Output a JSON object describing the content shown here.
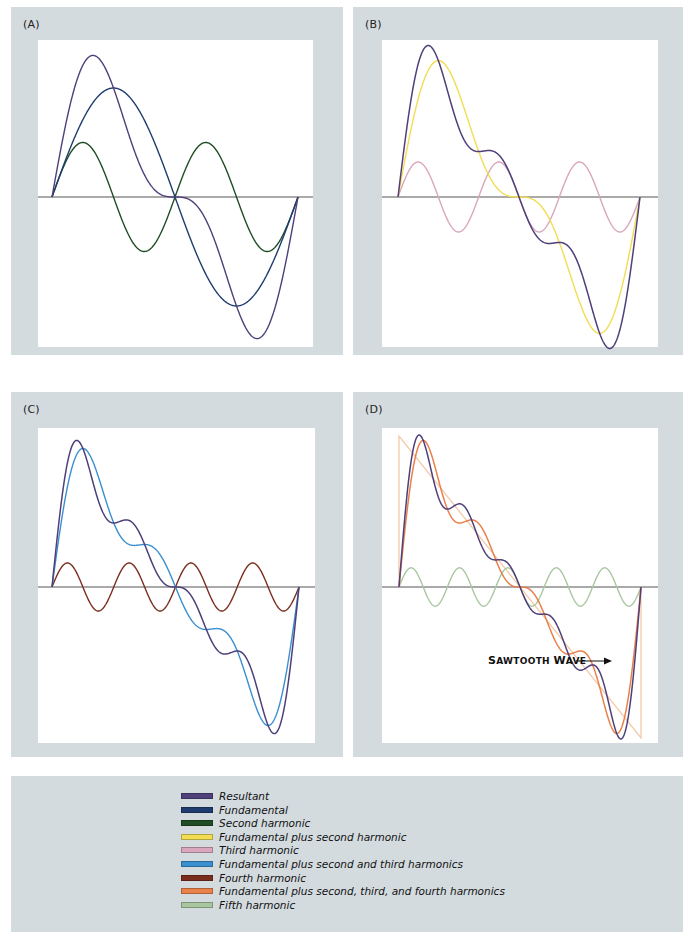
{
  "figure": {
    "background_panel_color": "#d4dbdf",
    "plot_color": "#ffffff",
    "axis_color": "#555555"
  },
  "colors": {
    "resultant": "#4f3f7a",
    "fundamental": "#1e3c6e",
    "second_harmonic": "#1f4d24",
    "fund_plus_second": "#f2dc52",
    "third_harmonic": "#d9a7bd",
    "fund_plus_second_third": "#3a8fcf",
    "fourth_harmonic": "#7a2d1c",
    "fund_plus_second_third_fourth": "#e8814a",
    "fifth_harmonic": "#a8c7a0",
    "sawtooth": "#f3c9a8"
  },
  "panels": [
    {
      "id": "A",
      "label": "(A)",
      "outer": [
        11,
        7,
        332,
        348
      ],
      "plot": [
        38,
        40,
        275,
        307
      ],
      "axis_y": 197,
      "x0": 52,
      "x1": 298,
      "amp": 109,
      "curves": [
        {
          "name": "Second harmonic",
          "color_key": "second_harmonic",
          "harmonics": [
            2
          ],
          "width": 1.4
        },
        {
          "name": "Fundamental",
          "color_key": "fundamental",
          "harmonics": [
            1
          ],
          "width": 1.4
        },
        {
          "name": "Resultant",
          "color_key": "resultant",
          "harmonics": [
            1,
            2
          ],
          "width": 1.4
        }
      ]
    },
    {
      "id": "B",
      "label": "(B)",
      "outer": [
        353,
        7,
        330,
        348
      ],
      "plot": [
        382,
        40,
        276,
        307
      ],
      "axis_y": 197,
      "x0": 398,
      "x1": 640,
      "amp": 105,
      "curves": [
        {
          "name": "Third harmonic",
          "color_key": "third_harmonic",
          "harmonics": [
            3
          ],
          "width": 1.4
        },
        {
          "name": "Fundamental plus second harmonic",
          "color_key": "fund_plus_second",
          "harmonics": [
            1,
            2
          ],
          "width": 1.4
        },
        {
          "name": "Resultant",
          "color_key": "resultant",
          "harmonics": [
            1,
            2,
            3
          ],
          "width": 1.5
        }
      ]
    },
    {
      "id": "C",
      "label": "(C)",
      "outer": [
        11,
        392,
        332,
        365
      ],
      "plot": [
        38,
        428,
        277,
        315
      ],
      "axis_y": 587,
      "x0": 52,
      "x1": 299,
      "amp": 96,
      "curves": [
        {
          "name": "Fourth harmonic",
          "color_key": "fourth_harmonic",
          "harmonics": [
            4
          ],
          "width": 1.4
        },
        {
          "name": "Fundamental plus second and third harmonics",
          "color_key": "fund_plus_second_third",
          "harmonics": [
            1,
            2,
            3
          ],
          "width": 1.4
        },
        {
          "name": "Resultant",
          "color_key": "resultant",
          "harmonics": [
            1,
            2,
            3,
            4
          ],
          "width": 1.5
        }
      ]
    },
    {
      "id": "D",
      "label": "(D)",
      "outer": [
        353,
        392,
        330,
        365
      ],
      "plot": [
        382,
        428,
        276,
        315
      ],
      "axis_y": 587,
      "x0": 399,
      "x1": 641,
      "amp": 96,
      "sawtooth": true,
      "curves": [
        {
          "name": "Fifth harmonic",
          "color_key": "fifth_harmonic",
          "harmonics": [
            5
          ],
          "width": 1.4
        },
        {
          "name": "Fundamental plus second, third, and fourth harmonics",
          "color_key": "fund_plus_second_third_fourth",
          "harmonics": [
            1,
            2,
            3,
            4
          ],
          "width": 1.5
        },
        {
          "name": "Resultant",
          "color_key": "resultant",
          "harmonics": [
            1,
            2,
            3,
            4,
            5
          ],
          "width": 1.5
        }
      ],
      "annotation": {
        "text_s": "S",
        "text_rest1": "AWTOOTH ",
        "text_w": "W",
        "text_rest2": "AVE",
        "x": 488,
        "y": 654
      }
    }
  ],
  "legend": {
    "items": [
      {
        "label": "Resultant",
        "color_key": "resultant"
      },
      {
        "label": "Fundamental",
        "color_key": "fundamental"
      },
      {
        "label": "Second harmonic",
        "color_key": "second_harmonic"
      },
      {
        "label": "Fundamental plus second harmonic",
        "color_key": "fund_plus_second"
      },
      {
        "label": "Third harmonic",
        "color_key": "third_harmonic"
      },
      {
        "label": "Fundamental plus second and third harmonics",
        "color_key": "fund_plus_second_third"
      },
      {
        "label": "Fourth harmonic",
        "color_key": "fourth_harmonic"
      },
      {
        "label": "Fundamental plus second, third, and fourth harmonics",
        "color_key": "fund_plus_second_third_fourth"
      },
      {
        "label": "Fifth harmonic",
        "color_key": "fifth_harmonic"
      }
    ]
  },
  "chart_data": [
    {
      "type": "line",
      "title": "(A)",
      "x": "one period, 0 to 2π",
      "series": [
        {
          "name": "Fundamental",
          "formula": "sin(x)"
        },
        {
          "name": "Second harmonic",
          "formula": "sin(2x)/2"
        },
        {
          "name": "Resultant",
          "formula": "sin(x)+sin(2x)/2"
        }
      ]
    },
    {
      "type": "line",
      "title": "(B)",
      "series": [
        {
          "name": "Fundamental plus second harmonic",
          "formula": "sin(x)+sin(2x)/2"
        },
        {
          "name": "Third harmonic",
          "formula": "sin(3x)/3"
        },
        {
          "name": "Resultant",
          "formula": "sum n=1..3 sin(nx)/n"
        }
      ]
    },
    {
      "type": "line",
      "title": "(C)",
      "series": [
        {
          "name": "Fundamental plus second and third harmonics",
          "formula": "sum n=1..3 sin(nx)/n"
        },
        {
          "name": "Fourth harmonic",
          "formula": "sin(4x)/4"
        },
        {
          "name": "Resultant",
          "formula": "sum n=1..4 sin(nx)/n"
        }
      ]
    },
    {
      "type": "line",
      "title": "(D)",
      "series": [
        {
          "name": "Fundamental plus second, third, and fourth harmonics",
          "formula": "sum n=1..4 sin(nx)/n"
        },
        {
          "name": "Fifth harmonic",
          "formula": "sin(5x)/5"
        },
        {
          "name": "Resultant",
          "formula": "sum n=1..5 sin(nx)/n"
        },
        {
          "name": "Sawtooth Wave",
          "formula": "(π - x)/2"
        }
      ],
      "annotations": [
        "Sawtooth Wave →"
      ]
    }
  ]
}
